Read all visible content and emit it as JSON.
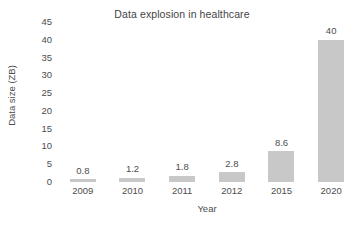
{
  "chart_data": {
    "type": "bar",
    "title": "Data explosion in healthcare",
    "xlabel": "Year",
    "ylabel": "Data size (ZB)",
    "categories": [
      "2009",
      "2010",
      "2011",
      "2012",
      "2015",
      "2020"
    ],
    "values": [
      0.8,
      1.2,
      1.8,
      2.8,
      8.6,
      40
    ],
    "value_labels": [
      "0.8",
      "1.2",
      "1.8",
      "2.8",
      "8.6",
      "40"
    ],
    "yticks": [
      45,
      40,
      35,
      30,
      25,
      20,
      15,
      10,
      5,
      0
    ],
    "ytick_labels": [
      "45",
      "40",
      "35",
      "30",
      "25",
      "20",
      "15",
      "10",
      "5",
      "0"
    ],
    "ylim": [
      0,
      45
    ],
    "grid": false,
    "legend": false,
    "bar_color": "#c8c8c8",
    "text_color": "#4d4d4d",
    "background_color": "#ffffff"
  }
}
